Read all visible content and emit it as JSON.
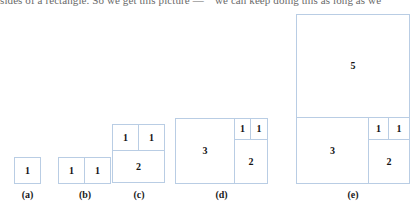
{
  "page": {
    "bleed_text_left": "sides of a rectangle.  So we get this picture —",
    "bleed_text_right": "we can keep doing this as long as we",
    "border_color": "#b9cde4",
    "background": "#ffffff",
    "numeral_color": "#141414"
  },
  "figures": [
    {
      "id": "a",
      "caption": "(a)",
      "squares": [
        {
          "label": "1",
          "size": 1
        }
      ]
    },
    {
      "id": "b",
      "caption": "(b)",
      "squares": [
        {
          "label": "1",
          "size": 1
        },
        {
          "label": "1",
          "size": 1
        }
      ]
    },
    {
      "id": "c",
      "caption": "(c)",
      "squares": [
        {
          "label": "1",
          "size": 1
        },
        {
          "label": "1",
          "size": 1
        },
        {
          "label": "2",
          "size": 2
        }
      ]
    },
    {
      "id": "d",
      "caption": "(d)",
      "squares": [
        {
          "label": "3",
          "size": 3
        },
        {
          "label": "1",
          "size": 1
        },
        {
          "label": "1",
          "size": 1
        },
        {
          "label": "2",
          "size": 2
        }
      ]
    },
    {
      "id": "e",
      "caption": "(e)",
      "squares": [
        {
          "label": "5",
          "size": 5
        },
        {
          "label": "3",
          "size": 3
        },
        {
          "label": "1",
          "size": 1
        },
        {
          "label": "1",
          "size": 1
        },
        {
          "label": "2",
          "size": 2
        }
      ]
    }
  ]
}
